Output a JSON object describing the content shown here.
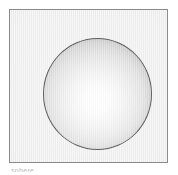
{
  "figure": {
    "name": "shaded-sphere-figure",
    "background_color": "#ffffff"
  },
  "panel": {
    "name": "sphere-panel",
    "fill_color": "#ececec",
    "border_color": "#8a8a8a",
    "border_width_px": 1,
    "x": 9,
    "y": 9,
    "width": 159,
    "height": 154
  },
  "sphere": {
    "name": "shaded-sphere",
    "outline_color": "#5d5d5d",
    "highlight_color": "#ffffff",
    "shadow_color": "#b0b0b0",
    "center_x": 96,
    "center_y": 93,
    "diameter_px": 109,
    "highlight_x_pct": 49,
    "highlight_y_pct": 56
  },
  "caption": {
    "name": "cropped-caption",
    "text": "sphere",
    "visible_fragment": "top edge only, illegible"
  }
}
